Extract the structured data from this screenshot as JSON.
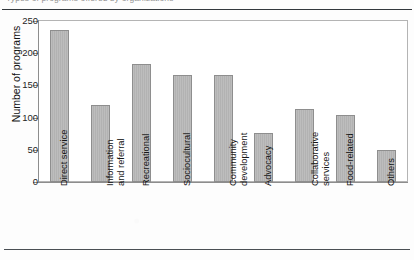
{
  "caption": {
    "text": "Types of programs offered by organizations"
  },
  "chart_data": {
    "type": "bar",
    "title": "",
    "xlabel": "",
    "ylabel": "Number of programs",
    "ylim": [
      0,
      250
    ],
    "ytick_labels": [
      "250",
      "200",
      "150",
      "100",
      "50",
      "0"
    ],
    "ytick_values": [
      250,
      200,
      150,
      100,
      50,
      0
    ],
    "grid": false,
    "legend": "none",
    "categories": [
      "Direct service",
      "Information\nand referral",
      "Recreational",
      "Sociocultural",
      "Community\ndevelopment",
      "Advocacy",
      "Collaborative\nservices",
      "Food-related",
      "Others"
    ],
    "values": [
      236,
      119,
      184,
      166,
      166,
      76,
      113,
      104,
      50
    ],
    "bar_color": "#b8b8b8",
    "bar_border_color": "#8e8e8e",
    "axis_color": "#8d8d8d",
    "text_color": "#141414"
  }
}
